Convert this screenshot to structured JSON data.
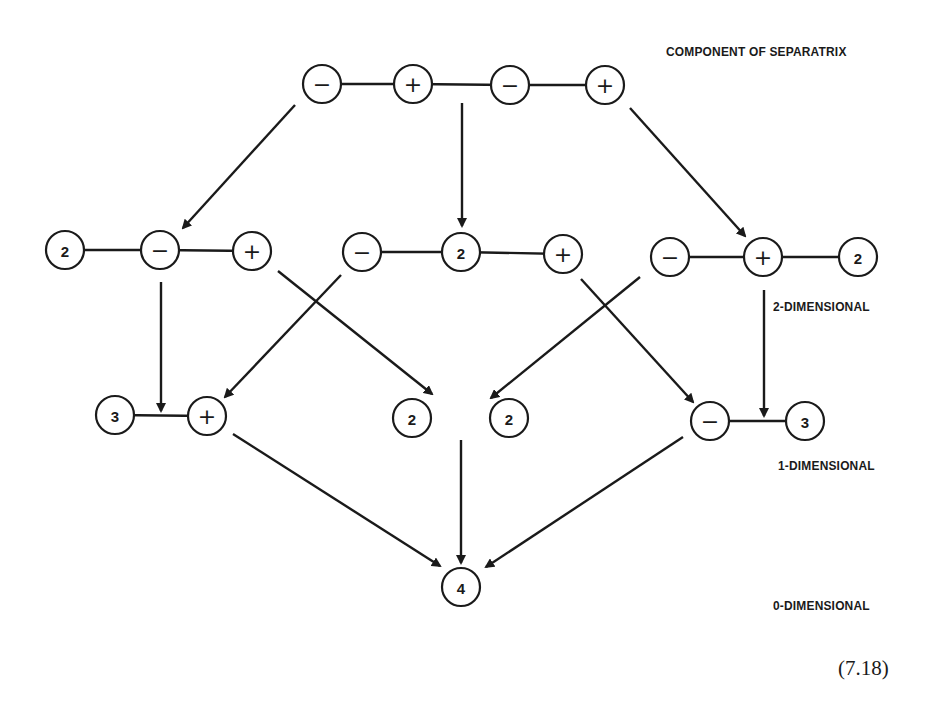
{
  "labels": {
    "component_of_separatrix": "COMPONENT OF SEPARATRIX",
    "two_dimensional": "2-DIMENSIONAL",
    "one_dimensional": "1-DIMENSIONAL",
    "zero_dimensional": "0-DIMENSIONAL",
    "equation_number": "(7.18)"
  },
  "nodes": [
    {
      "id": "t1",
      "label": "−",
      "kind": "sign",
      "x": 322,
      "y": 84
    },
    {
      "id": "t2",
      "label": "+",
      "kind": "sign",
      "x": 413,
      "y": 84
    },
    {
      "id": "t3",
      "label": "−",
      "kind": "sign",
      "x": 510,
      "y": 85
    },
    {
      "id": "t4",
      "label": "+",
      "kind": "sign",
      "x": 605,
      "y": 85
    },
    {
      "id": "a1",
      "label": "2",
      "kind": "num",
      "x": 65,
      "y": 250
    },
    {
      "id": "a2",
      "label": "−",
      "kind": "sign",
      "x": 160,
      "y": 250
    },
    {
      "id": "a3",
      "label": "+",
      "kind": "sign",
      "x": 252,
      "y": 251
    },
    {
      "id": "b1",
      "label": "−",
      "kind": "sign",
      "x": 362,
      "y": 252
    },
    {
      "id": "b2",
      "label": "2",
      "kind": "num",
      "x": 461,
      "y": 252
    },
    {
      "id": "b3",
      "label": "+",
      "kind": "sign",
      "x": 563,
      "y": 254
    },
    {
      "id": "c1",
      "label": "−",
      "kind": "sign",
      "x": 670,
      "y": 257
    },
    {
      "id": "c2",
      "label": "+",
      "kind": "sign",
      "x": 763,
      "y": 257
    },
    {
      "id": "c3",
      "label": "2",
      "kind": "num",
      "x": 858,
      "y": 257
    },
    {
      "id": "d1",
      "label": "3",
      "kind": "num",
      "x": 115,
      "y": 415
    },
    {
      "id": "d2",
      "label": "+",
      "kind": "sign",
      "x": 207,
      "y": 416
    },
    {
      "id": "e1",
      "label": "2",
      "kind": "num",
      "x": 412,
      "y": 418
    },
    {
      "id": "e2",
      "label": "2",
      "kind": "num",
      "x": 509,
      "y": 418
    },
    {
      "id": "f1",
      "label": "−",
      "kind": "sign",
      "x": 710,
      "y": 421
    },
    {
      "id": "f2",
      "label": "3",
      "kind": "num",
      "x": 805,
      "y": 421
    },
    {
      "id": "g1",
      "label": "4",
      "kind": "num",
      "x": 461,
      "y": 587
    }
  ],
  "links": [
    {
      "from": "t1",
      "to": "t2"
    },
    {
      "from": "t2",
      "to": "t3"
    },
    {
      "from": "t3",
      "to": "t4"
    },
    {
      "from": "a1",
      "to": "a2"
    },
    {
      "from": "a2",
      "to": "a3"
    },
    {
      "from": "b1",
      "to": "b2"
    },
    {
      "from": "b2",
      "to": "b3"
    },
    {
      "from": "c1",
      "to": "c2"
    },
    {
      "from": "c2",
      "to": "c3"
    },
    {
      "from": "d1",
      "to": "d2"
    },
    {
      "from": "f1",
      "to": "f2"
    }
  ],
  "arrows": [
    {
      "x1": 295,
      "y1": 105,
      "x2": 183,
      "y2": 228
    },
    {
      "x1": 462,
      "y1": 103,
      "x2": 462,
      "y2": 226
    },
    {
      "x1": 630,
      "y1": 108,
      "x2": 745,
      "y2": 236
    },
    {
      "x1": 161,
      "y1": 282,
      "x2": 161,
      "y2": 411
    },
    {
      "x1": 341,
      "y1": 275,
      "x2": 225,
      "y2": 397
    },
    {
      "x1": 278,
      "y1": 271,
      "x2": 432,
      "y2": 394
    },
    {
      "x1": 640,
      "y1": 277,
      "x2": 491,
      "y2": 398
    },
    {
      "x1": 581,
      "y1": 279,
      "x2": 693,
      "y2": 402
    },
    {
      "x1": 764,
      "y1": 290,
      "x2": 764,
      "y2": 416
    },
    {
      "x1": 233,
      "y1": 434,
      "x2": 440,
      "y2": 566
    },
    {
      "x1": 461,
      "y1": 440,
      "x2": 461,
      "y2": 563
    },
    {
      "x1": 683,
      "y1": 437,
      "x2": 486,
      "y2": 567
    }
  ],
  "style": {
    "ink_color": "#1a1a1a",
    "background": "#ffffff",
    "node_radius": 19
  }
}
